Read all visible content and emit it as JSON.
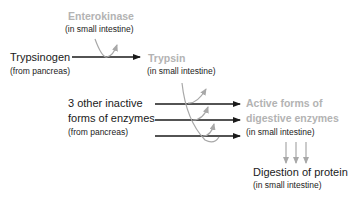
{
  "diagram": {
    "colors": {
      "text": "#1a1a1a",
      "highlight_text": "#b3b3b3",
      "arrow": "#1a1a1a",
      "catalysis_arrow": "#a8a8a8"
    },
    "nodes": {
      "enterokinase": {
        "name": "Enterokinase",
        "location": "(in small intestine)"
      },
      "trypsinogen": {
        "name": "Trypsinogen",
        "location": "(from pancreas)"
      },
      "trypsin": {
        "name": "Trypsin",
        "location": "(in small intestine)"
      },
      "inactive_enzymes": {
        "line1": "3 other inactive",
        "line2": "forms of enzymes",
        "location": "(from pancreas)"
      },
      "active_enzymes": {
        "line1": "Active forms of",
        "line2": "digestive enzymes",
        "location": "(in small intestine)"
      },
      "digestion": {
        "name": "Digestion of protein",
        "location": "(in small intestine)"
      }
    },
    "edges": [
      {
        "from": "Trypsinogen",
        "to": "Trypsin",
        "catalyst": "Enterokinase"
      },
      {
        "from": "3 other inactive forms of enzymes",
        "to": "Active forms of digestive enzymes",
        "catalyst": "Trypsin",
        "count": 3
      },
      {
        "from": "Active forms of digestive enzymes",
        "to": "Digestion of protein",
        "count": 3
      }
    ]
  }
}
